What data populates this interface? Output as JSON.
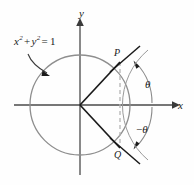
{
  "figure": {
    "width": 194,
    "height": 185,
    "background_color": "#fefefe"
  },
  "labels": {
    "equation": {
      "text": "x2 + y2 = 1",
      "var_x": "x",
      "var_y": "y",
      "exponent": "2",
      "plus": "+",
      "equals": "=",
      "value": "1"
    },
    "y_axis": "y",
    "x_axis": "x",
    "point_p": "P",
    "point_q": "Q",
    "theta_positive": "θ",
    "theta_negative": "−θ",
    "theta_negative_sign": "−",
    "theta_symbol": "θ"
  },
  "geometry": {
    "origin": {
      "x": 80,
      "y": 105
    },
    "circle_radius": 50,
    "point_p": {
      "x": 120,
      "y": 62
    },
    "point_q": {
      "x": 120,
      "y": 148
    },
    "angle_degrees": 47,
    "negative_angle_degrees": -47
  },
  "colors": {
    "circle_stroke": "#8e8e8e",
    "axis_stroke": "#4a4a4a",
    "radius_stroke": "#1a1a1a",
    "dashed_chord": "#b4b4b4",
    "arc_stroke": "#8a8a8a",
    "pointer_stroke": "#3a3a3a",
    "tick_stroke": "#1a1a1a",
    "text": "#1a1a1a",
    "background": "#fefefe"
  }
}
